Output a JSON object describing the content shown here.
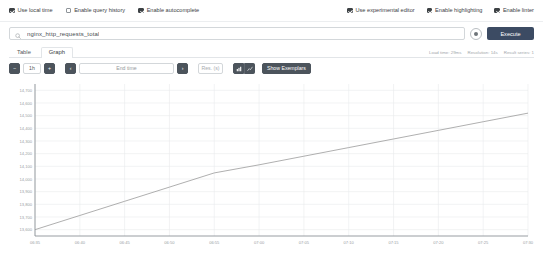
{
  "options": {
    "left": [
      {
        "label": "Use local time",
        "checked": true,
        "name": "use-local-time"
      },
      {
        "label": "Enable query history",
        "checked": false,
        "name": "enable-query-history"
      },
      {
        "label": "Enable autocomplete",
        "checked": true,
        "name": "enable-autocomplete"
      }
    ],
    "right": [
      {
        "label": "Use experimental editor",
        "checked": true,
        "name": "use-experimental-editor"
      },
      {
        "label": "Enable highlighting",
        "checked": true,
        "name": "enable-highlighting"
      },
      {
        "label": "Enable linter",
        "checked": true,
        "name": "enable-linter"
      }
    ]
  },
  "query": {
    "value": "nginx_http_requests_total",
    "placeholder": "Expression (press Shift+Enter for newlines)",
    "execute_label": "Execute",
    "search_icon": "search-icon",
    "options_icon": "query-options-icon"
  },
  "tabs": [
    {
      "label": "Table",
      "active": false
    },
    {
      "label": "Graph",
      "active": true
    }
  ],
  "meta": {
    "load_time": "Load time: 29ms",
    "resolution": "Resolution: 14s",
    "result_series": "Result series: 1"
  },
  "controls": {
    "decrease_range": "−",
    "range_value": "1h",
    "increase_range": "+",
    "step_back": "‹",
    "end_time_placeholder": "End time",
    "step_forward": "›",
    "resolution_placeholder": "Res. (s)",
    "stacked_icon": "stacked-chart-icon",
    "lines_icon": "line-chart-icon",
    "show_exemplars": "Show Exemplars"
  },
  "chart_data": {
    "type": "line",
    "title": "",
    "xlabel": "",
    "ylabel": "",
    "grid": true,
    "legend": false,
    "series": [
      {
        "name": "nginx_http_requests_total",
        "color": "#9b9b9b",
        "x": [
          "06:35",
          "06:40",
          "06:45",
          "06:50",
          "06:55",
          "07:00",
          "07:05",
          "07:10",
          "07:15",
          "07:20",
          "07:25",
          "07:30"
        ],
        "values": [
          13600,
          13712,
          13824,
          13936,
          14048,
          14112,
          14180,
          14248,
          14316,
          14384,
          14452,
          14520
        ]
      }
    ],
    "x_ticks": [
      "06:35",
      "06:40",
      "06:45",
      "06:50",
      "06:55",
      "07:00",
      "07:05",
      "07:10",
      "07:15",
      "07:20",
      "07:25",
      "07:30"
    ],
    "y_ticks": [
      "13,600",
      "13,700",
      "13,800",
      "13,900",
      "14,000",
      "14,100",
      "14,200",
      "14,300",
      "14,400",
      "14,500",
      "14,600",
      "14,700"
    ],
    "ylim": [
      13550,
      14750
    ],
    "xlim": [
      0,
      11
    ]
  }
}
